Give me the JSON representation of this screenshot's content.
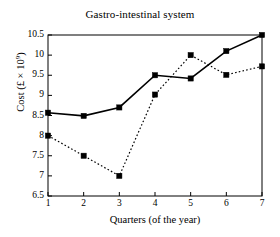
{
  "chart_data": {
    "type": "line",
    "title": "Gastro-intestinal system",
    "xlabel": "Quarters (of the year)",
    "ylabel": "Cost (£ × 10⁹)",
    "ylabel_base": "Cost (£ × 10",
    "ylabel_exp": "9",
    "ylabel_close": ")",
    "x": [
      1,
      2,
      3,
      4,
      5,
      6,
      7
    ],
    "xtick_labels": [
      "1",
      "2",
      "3",
      "4",
      "5",
      "6",
      "7"
    ],
    "ytick_labels": [
      "10.5",
      "10",
      "9.5",
      "9",
      "8.5",
      "8",
      "7.5",
      "7",
      "6.5"
    ],
    "ytick_values": [
      10.5,
      10,
      9.5,
      9,
      8.5,
      8,
      7.5,
      7,
      6.5
    ],
    "xlim": [
      1,
      7
    ],
    "ylim": [
      6.5,
      10.5
    ],
    "grid": false,
    "legend": "none",
    "series": [
      {
        "name": "solid-series",
        "style": "solid",
        "marker": "filled-square",
        "color": "#000000",
        "values": [
          8.57,
          8.49,
          8.7,
          9.5,
          9.42,
          10.1,
          10.5
        ]
      },
      {
        "name": "dotted-series",
        "style": "dotted",
        "marker": "filled-square",
        "color": "#000000",
        "values": [
          8.0,
          7.5,
          7.0,
          9.02,
          10.0,
          9.51,
          9.72
        ]
      }
    ]
  },
  "axes": {
    "frame_color": "#000000"
  }
}
